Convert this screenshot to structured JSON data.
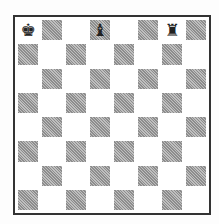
{
  "board": {
    "size": 8,
    "top_left_color": "light",
    "pieces": [
      {
        "square": "a8",
        "row": 0,
        "col": 0,
        "glyph": "♚",
        "name": "black-king"
      },
      {
        "square": "d8",
        "row": 0,
        "col": 3,
        "glyph": "♝",
        "name": "black-bishop"
      },
      {
        "square": "g8",
        "row": 0,
        "col": 6,
        "glyph": "♜",
        "name": "black-rook"
      }
    ]
  }
}
